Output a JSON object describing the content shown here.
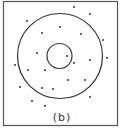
{
  "figure": {
    "label": "(b)",
    "frame": {
      "x": 3.5,
      "y": 1.5,
      "w": 114,
      "h": 124,
      "color": "#555555"
    },
    "outer_circle": {
      "cx": 60,
      "cy": 56,
      "r": 42.5
    },
    "inner_circle": {
      "cx": 59.5,
      "cy": 56,
      "r": 12.5
    },
    "line_color": "#333333",
    "dot_color": "#333333",
    "dots": [
      [
        74,
        7
      ],
      [
        90,
        14
      ],
      [
        27,
        21
      ],
      [
        60,
        27
      ],
      [
        42,
        33
      ],
      [
        81,
        34
      ],
      [
        103,
        40
      ],
      [
        37,
        53
      ],
      [
        67,
        56
      ],
      [
        107,
        58
      ],
      [
        74,
        63
      ],
      [
        90,
        60
      ],
      [
        15,
        65
      ],
      [
        28,
        70
      ],
      [
        45,
        70
      ],
      [
        68,
        80
      ],
      [
        85,
        80
      ],
      [
        20,
        87
      ],
      [
        42,
        88
      ],
      [
        53,
        89
      ],
      [
        90,
        97
      ],
      [
        32,
        101
      ],
      [
        45,
        106
      ]
    ]
  }
}
